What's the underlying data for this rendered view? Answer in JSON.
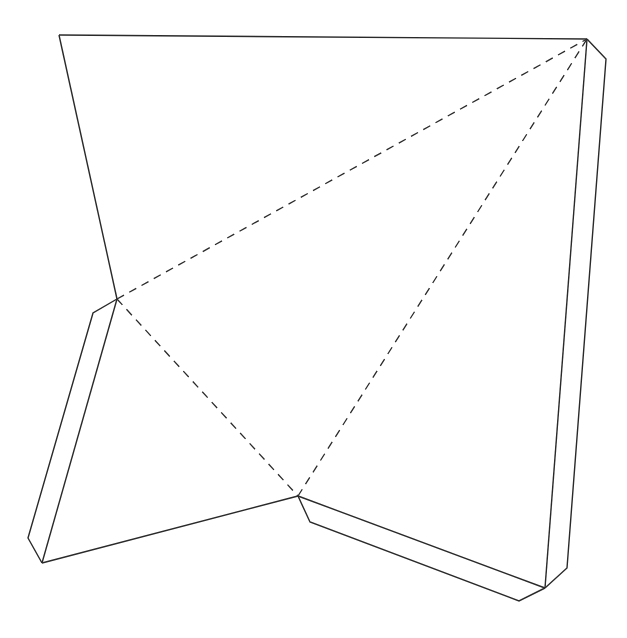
{
  "diagram": {
    "title": "",
    "type": "paper-net-template",
    "line_styles": {
      "cut": {
        "color": "#2a2a2a",
        "pattern": "solid"
      },
      "fold": {
        "color": "#2a2a2a",
        "pattern": "dashed"
      }
    },
    "faces": [
      {
        "name": "top-face"
      },
      {
        "name": "left-face"
      },
      {
        "name": "right-face"
      }
    ],
    "tabs": [
      {
        "name": "left-glue-tab"
      },
      {
        "name": "bottom-glue-tab"
      },
      {
        "name": "right-glue-tab"
      }
    ],
    "fold_lines": [
      {
        "name": "fold-left-to-top-right"
      },
      {
        "name": "fold-left-to-bottom-center"
      },
      {
        "name": "fold-bottom-center-to-top-right"
      }
    ]
  }
}
